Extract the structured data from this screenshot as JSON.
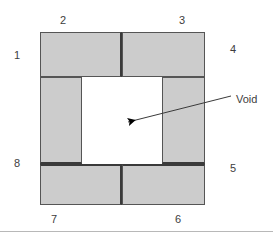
{
  "figure": {
    "shape_type": "square-ring",
    "fill_color": "#cccccc",
    "edge_color": "#555555",
    "divider_color": "#3a3a3a",
    "void_color": "#ffffff",
    "label_color": "#3d3d3d",
    "background_color": "#ffffff"
  },
  "geometry": {
    "outer": {
      "left": 40,
      "top": 32,
      "right": 205,
      "bottom": 205
    },
    "void": {
      "left": 82,
      "top": 77,
      "right": 162,
      "bottom": 164
    },
    "top_row_divider_x": 122,
    "bottom_row_divider_x": 122
  },
  "blocks": [
    {
      "id": "block-2",
      "label": "2",
      "left": 40,
      "top": 32,
      "width": 82,
      "height": 45
    },
    {
      "id": "block-3",
      "label": "3",
      "left": 122,
      "top": 32,
      "width": 83,
      "height": 45
    },
    {
      "id": "block-1",
      "label": "1",
      "left": 40,
      "top": 77,
      "width": 42,
      "height": 87
    },
    {
      "id": "block-4",
      "label": "4",
      "left": 162,
      "top": 77,
      "width": 43,
      "height": 87
    },
    {
      "id": "block-7",
      "label": "7",
      "left": 40,
      "top": 164,
      "width": 82,
      "height": 41
    },
    {
      "id": "block-6",
      "label": "6",
      "left": 122,
      "top": 164,
      "width": 83,
      "height": 41
    }
  ],
  "segment_labels": [
    {
      "name": "segment-label-1",
      "text": "1",
      "left": 14,
      "top": 50
    },
    {
      "name": "segment-label-2",
      "text": "2",
      "left": 60,
      "top": 15
    },
    {
      "name": "segment-label-3",
      "text": "3",
      "left": 179,
      "top": 15
    },
    {
      "name": "segment-label-4",
      "text": "4",
      "left": 230,
      "top": 44
    },
    {
      "name": "segment-label-5",
      "text": "5",
      "left": 230,
      "top": 163
    },
    {
      "name": "segment-label-6",
      "text": "6",
      "left": 175,
      "top": 214
    },
    {
      "name": "segment-label-7",
      "text": "7",
      "left": 51,
      "top": 214
    },
    {
      "name": "segment-label-8",
      "text": "8",
      "left": 14,
      "top": 158
    }
  ],
  "annotation": {
    "name": "void-callout",
    "text": "Void",
    "text_left": 236,
    "text_top": 94,
    "leader_line": {
      "x1": 231,
      "y1": 96,
      "x2": 137,
      "y2": 120
    },
    "arrow_tip": {
      "x": 128,
      "y": 122
    },
    "arrow_color": "#000000"
  },
  "rule": {
    "name": "bottom-divider-rule",
    "top": 231,
    "color": "#b8b8b8"
  }
}
